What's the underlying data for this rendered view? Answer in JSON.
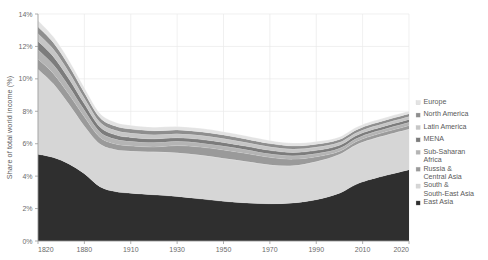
{
  "chart_data": {
    "type": "area",
    "stacked": true,
    "title": "",
    "subtitle": "",
    "xlabel": "",
    "ylabel": "Share of total world income (%)",
    "xlim": [
      1820,
      2020
    ],
    "ylim": [
      0,
      14
    ],
    "grid": true,
    "legend_position": "right",
    "x_tick_labels": [
      "1820",
      "1880",
      "1910",
      "1930",
      "1950",
      "1970",
      "1990",
      "2010",
      "2020"
    ],
    "x_ticks": [
      1820,
      1880,
      1910,
      1930,
      1950,
      1970,
      1990,
      2010,
      2020
    ],
    "y_tick_labels": [
      "0%",
      "2%",
      "4%",
      "6%",
      "8%",
      "10%",
      "12%",
      "14%"
    ],
    "y_ticks": [
      0,
      2,
      4,
      6,
      8,
      10,
      12,
      14
    ],
    "x": [
      1820,
      1840,
      1860,
      1880,
      1890,
      1900,
      1910,
      1920,
      1930,
      1940,
      1950,
      1960,
      1970,
      1980,
      1990,
      2000,
      2010,
      2020
    ],
    "series": [
      {
        "name": "East Asia",
        "color": "#2f2f2f",
        "values": [
          5.35,
          5.15,
          4.75,
          4.15,
          3.35,
          3.05,
          2.95,
          2.85,
          2.75,
          2.6,
          2.45,
          2.35,
          2.3,
          2.35,
          2.55,
          2.95,
          3.65,
          4.4
        ]
      },
      {
        "name": "South & South-East Asia",
        "color": "#d6d6d6",
        "values": [
          5.25,
          4.55,
          3.7,
          2.95,
          2.65,
          2.6,
          2.6,
          2.65,
          2.7,
          2.7,
          2.65,
          2.55,
          2.4,
          2.3,
          2.35,
          2.4,
          2.45,
          2.5
        ]
      },
      {
        "name": "Russia & Central Asia",
        "color": "#9a9a9a",
        "values": [
          0.62,
          0.62,
          0.6,
          0.56,
          0.4,
          0.34,
          0.32,
          0.3,
          0.44,
          0.5,
          0.52,
          0.5,
          0.46,
          0.4,
          0.3,
          0.18,
          0.2,
          0.22
        ]
      },
      {
        "name": "Sub-Saharan Africa",
        "color": "#b4b4b4",
        "values": [
          0.58,
          0.55,
          0.5,
          0.42,
          0.34,
          0.3,
          0.28,
          0.27,
          0.26,
          0.25,
          0.24,
          0.23,
          0.22,
          0.21,
          0.2,
          0.19,
          0.19,
          0.2
        ]
      },
      {
        "name": "MENA",
        "color": "#7c7c7c",
        "values": [
          0.52,
          0.5,
          0.46,
          0.38,
          0.3,
          0.26,
          0.24,
          0.23,
          0.22,
          0.22,
          0.22,
          0.21,
          0.21,
          0.2,
          0.19,
          0.18,
          0.18,
          0.18
        ]
      },
      {
        "name": "Latin America",
        "color": "#c6c6c6",
        "values": [
          0.48,
          0.46,
          0.42,
          0.36,
          0.3,
          0.28,
          0.27,
          0.26,
          0.25,
          0.25,
          0.24,
          0.23,
          0.22,
          0.21,
          0.2,
          0.19,
          0.18,
          0.18
        ]
      },
      {
        "name": "North America",
        "color": "#8e8e8e",
        "values": [
          0.42,
          0.4,
          0.38,
          0.33,
          0.28,
          0.26,
          0.25,
          0.24,
          0.23,
          0.22,
          0.22,
          0.21,
          0.2,
          0.19,
          0.18,
          0.17,
          0.17,
          0.17
        ]
      },
      {
        "name": "Europe",
        "color": "#e3e3e3",
        "values": [
          0.38,
          0.36,
          0.34,
          0.3,
          0.26,
          0.24,
          0.23,
          0.22,
          0.21,
          0.21,
          0.2,
          0.2,
          0.19,
          0.18,
          0.17,
          0.16,
          0.16,
          0.16
        ]
      }
    ]
  },
  "legend": {
    "items": [
      {
        "label": "Europe",
        "color": "#e3e3e3"
      },
      {
        "label": "North America",
        "color": "#8e8e8e"
      },
      {
        "label": "Latin America",
        "color": "#c6c6c6"
      },
      {
        "label": "MENA",
        "color": "#7c7c7c"
      },
      {
        "label": "Sub-Saharan",
        "label2": "Africa",
        "color": "#b4b4b4"
      },
      {
        "label": "Russia &",
        "label2": "Central Asia",
        "color": "#9a9a9a"
      },
      {
        "label": "South &",
        "label2": "South-East Asia",
        "color": "#d6d6d6"
      },
      {
        "label": "East Asia",
        "label2": "",
        "color": "#2f2f2f"
      }
    ]
  },
  "colors": {
    "background": "#ffffff",
    "grid": "#e9e9ea",
    "axis": "#9a9a9a",
    "text": "#5a5a5a"
  }
}
